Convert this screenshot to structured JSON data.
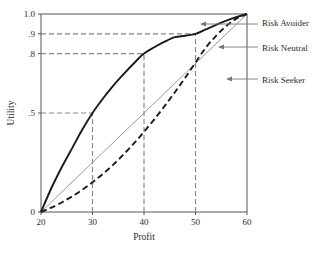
{
  "chart_data": {
    "type": "line",
    "title": "",
    "xlabel": "Profit",
    "ylabel": "Utility",
    "xlim": [
      20,
      60
    ],
    "ylim": [
      0,
      1.0
    ],
    "grid": false,
    "legend_position": "right-annotations",
    "x_ticks": [
      "20",
      "30",
      "40",
      "50",
      "60"
    ],
    "x_tick_values": [
      20,
      30,
      40,
      50,
      60
    ],
    "y_ticks": [
      "0",
      ".5",
      ".8",
      ".9",
      "1.0"
    ],
    "y_tick_values": [
      0,
      0.5,
      0.8,
      0.9,
      1.0
    ],
    "series": [
      {
        "name": "Risk Avoider",
        "style": "solid-thick",
        "color": "#1a1a1a",
        "x": [
          20,
          22,
          24,
          26,
          28,
          30,
          32,
          34,
          36,
          38,
          40,
          42,
          44,
          46,
          48,
          50,
          52,
          54,
          56,
          58,
          60
        ],
        "values": [
          0.0,
          0.12,
          0.225,
          0.32,
          0.415,
          0.5,
          0.572,
          0.637,
          0.695,
          0.75,
          0.8,
          0.832,
          0.86,
          0.883,
          0.89,
          0.9,
          0.922,
          0.945,
          0.966,
          0.985,
          1.0
        ]
      },
      {
        "name": "Risk Neutral",
        "style": "solid-thin",
        "color": "#8c8c8c",
        "x": [
          20,
          60
        ],
        "values": [
          0.0,
          1.0
        ]
      },
      {
        "name": "Risk Seeker",
        "style": "dashed-thick",
        "color": "#1a1a1a",
        "x": [
          20,
          22,
          24,
          26,
          28,
          30,
          32,
          34,
          36,
          38,
          40,
          42,
          44,
          46,
          48,
          50,
          52,
          54,
          56,
          58,
          60
        ],
        "values": [
          0.0,
          0.022,
          0.048,
          0.078,
          0.112,
          0.15,
          0.192,
          0.238,
          0.29,
          0.345,
          0.405,
          0.468,
          0.535,
          0.605,
          0.678,
          0.755,
          0.83,
          0.89,
          0.94,
          0.978,
          1.0
        ]
      }
    ],
    "reference_lines": {
      "color": "#888888",
      "style": "dashed",
      "horizontal": [
        {
          "y": 0.5,
          "from_x": 20,
          "to_x": 30,
          "label": ".5"
        },
        {
          "y": 0.8,
          "from_x": 20,
          "to_x": 40,
          "label": ".8"
        },
        {
          "y": 0.9,
          "from_x": 20,
          "to_x": 50,
          "label": ".9"
        }
      ],
      "vertical": [
        {
          "x": 30,
          "from_y": 0,
          "to_y": 0.5,
          "label": "30"
        },
        {
          "x": 40,
          "from_y": 0,
          "to_y": 0.8,
          "label": "40"
        },
        {
          "x": 50,
          "from_y": 0,
          "to_y": 0.9,
          "label": "50"
        }
      ]
    },
    "annotations": [
      {
        "label": "Risk Avoider",
        "target_series": "Risk Avoider"
      },
      {
        "label": "Risk Neutral",
        "target_series": "Risk Neutral"
      },
      {
        "label": "Risk Seeker",
        "target_series": "Risk Seeker"
      }
    ],
    "colors": {
      "axis": "#555555",
      "curve_primary": "#1a1a1a",
      "curve_neutral": "#8c8c8c",
      "reference": "#888888",
      "leader": "#777777",
      "text": "#2b2b2b",
      "background": "#ffffff"
    }
  }
}
